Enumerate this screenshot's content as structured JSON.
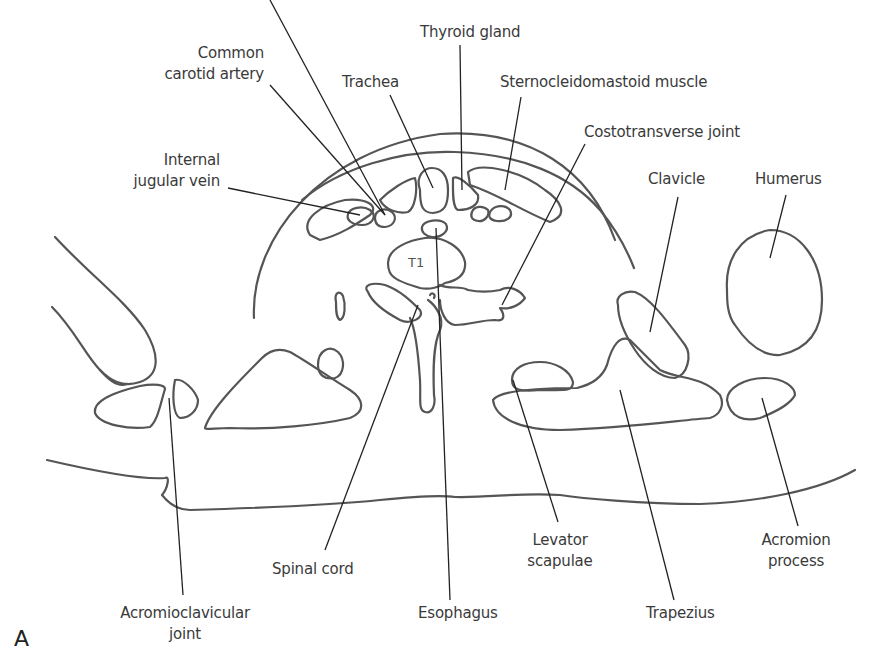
{
  "figure": {
    "letter": "A",
    "vertebra_label": "T1",
    "stroke_color": "#555555",
    "leader_color": "#222222",
    "text_color": "#3a3a3a"
  },
  "labels": {
    "common_carotid_artery": "Common\ncarotid artery",
    "thyroid_gland": "Thyroid gland",
    "trachea": "Trachea",
    "sternocleidomastoid_muscle": "Sternocleidomastoid muscle",
    "costotransverse_joint": "Costotransverse joint",
    "internal_jugular_vein": "Internal\njugular vein",
    "clavicle": "Clavicle",
    "humerus": "Humerus",
    "spinal_cord": "Spinal cord",
    "levator_scapulae": "Levator\nscapulae",
    "acromion_process": "Acromion\nprocess",
    "acromioclavicular_joint": "Acromioclavicular\njoint",
    "esophagus": "Esophagus",
    "trapezius": "Trapezius"
  }
}
